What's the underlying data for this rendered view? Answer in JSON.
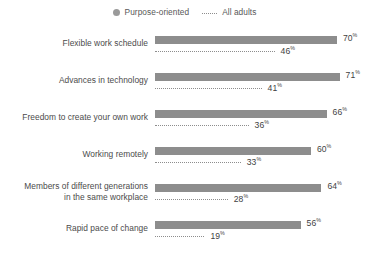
{
  "legend": {
    "items": [
      {
        "label": "Purpose-oriented",
        "marker": "dot",
        "color": "#9a9a9a"
      },
      {
        "label": "All adults",
        "marker": "dotted-line",
        "color": "#8d8d8d"
      }
    ]
  },
  "chart_data": {
    "type": "bar",
    "title": "",
    "subtitle": "",
    "xlabel": "",
    "ylabel": "",
    "grid": false,
    "legend_position": "top-center",
    "orientation": "horizontal",
    "value_suffix": "%",
    "xlim": [
      0,
      80
    ],
    "categories": [
      "Flexible work schedule",
      "Advances in technology",
      "Freedom to create your own work",
      "Working remotely",
      "Members of different generations in the same workplace",
      "Rapid pace of change"
    ],
    "category_lines": [
      [
        "Flexible work schedule"
      ],
      [
        "Advances in technology"
      ],
      [
        "Freedom to create your own work"
      ],
      [
        "Working remotely"
      ],
      [
        "Members of different generations",
        "in the same workplace"
      ],
      [
        "Rapid pace of change"
      ]
    ],
    "series": [
      {
        "name": "Purpose-oriented",
        "style": "bar",
        "color": "#8d8d8d",
        "values": [
          70,
          71,
          66,
          60,
          64,
          56
        ],
        "labels": [
          "70",
          "71",
          "66",
          "60",
          "64",
          "56"
        ]
      },
      {
        "name": "All adults",
        "style": "dotted-line",
        "color": "#8d8d8d",
        "values": [
          46,
          41,
          36,
          33,
          28,
          19
        ],
        "labels": [
          "46",
          "41",
          "36",
          "33",
          "28",
          "19"
        ]
      }
    ]
  },
  "colors": {
    "background": "#ffffff",
    "bar": "#8d8d8d",
    "dotted": "#8d8d8d",
    "label_text": "#4b4b4b",
    "value_text": "#3f3f3f",
    "legend_text": "#585858"
  }
}
